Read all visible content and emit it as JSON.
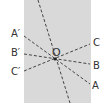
{
  "diagram": {
    "center": {
      "label": "O",
      "x": 55,
      "y": 59
    },
    "lines": [
      {
        "name": "vertical",
        "x1": 38,
        "y1": 0,
        "x2": 70,
        "y2": 103
      },
      {
        "name": "AA'",
        "from": "A'",
        "to": "A",
        "x1": 24,
        "y1": 36,
        "x2": 90,
        "y2": 84
      },
      {
        "name": "BB'",
        "from": "B'",
        "to": "B",
        "x1": 24,
        "y1": 54,
        "x2": 90,
        "y2": 64
      },
      {
        "name": "CC'",
        "from": "C'",
        "to": "C",
        "x1": 24,
        "y1": 71,
        "x2": 90,
        "y2": 44
      }
    ],
    "labels": {
      "o": "O",
      "a_prime": "A′",
      "b_prime": "B′",
      "c_prime": "C′",
      "a": "A",
      "b": "B",
      "c": "C"
    },
    "colors": {
      "panel": "#d9d9d9",
      "line": "#444444"
    }
  }
}
